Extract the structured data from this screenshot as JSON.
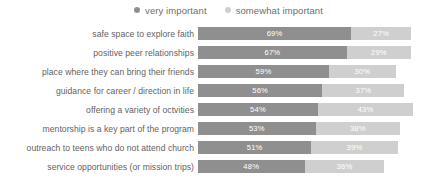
{
  "legend": {
    "position": "top-center",
    "entries": [
      {
        "label": "very important",
        "marker": "dot-icon",
        "color": "#8f8f8f"
      },
      {
        "label": "somewhat important",
        "marker": "dot-icon",
        "color": "#cfcfcf"
      }
    ]
  },
  "colors": {
    "primary": "#8f8f8f",
    "secondary": "#cfcfcf",
    "label_text": "#5f5f5f",
    "legend_text": "#6e6e6e",
    "value_text": "#ffffff",
    "background": "#ffffff"
  },
  "chart_data": {
    "type": "bar",
    "orientation": "horizontal",
    "stacked": true,
    "title": "",
    "subtitle": "",
    "xlabel": "",
    "ylabel": "",
    "xlim": [
      0,
      100
    ],
    "grid": false,
    "legend_position": "top-center",
    "value_suffix": "%",
    "categories": [
      "safe space to explore faith",
      "positive peer relationships",
      "place where they can bring their friends",
      "guidance for career / direction in life",
      "offering a variety of octvities",
      "mentorship is a key part of the program",
      "outreach to teens who do not attend church",
      "service opportunities (or mission trips)"
    ],
    "series": [
      {
        "name": "very important",
        "color": "#8f8f8f",
        "values": [
          69,
          67,
          59,
          56,
          54,
          53,
          51,
          48
        ],
        "labels": [
          "69%",
          "67%",
          "59%",
          "56%",
          "54%",
          "53%",
          "51%",
          "48%"
        ]
      },
      {
        "name": "somewhat important",
        "color": "#cfcfcf",
        "values": [
          27,
          29,
          30,
          37,
          43,
          38,
          39,
          36
        ],
        "labels": [
          "27%",
          "29%",
          "30%",
          "37%",
          "43%",
          "38%",
          "39%",
          "36%"
        ]
      }
    ]
  }
}
